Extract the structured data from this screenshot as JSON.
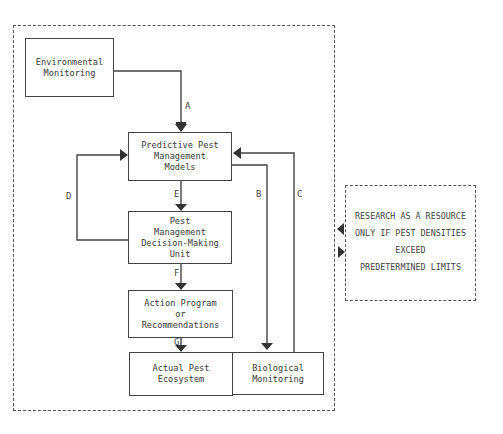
{
  "diagram": {
    "nodes": {
      "env": {
        "label": "Environmental\nMonitoring"
      },
      "predictive": {
        "label": "Predictive Pest\nManagement\nModels"
      },
      "decision": {
        "label": "Pest\nManagement\nDecision-Making\nUnit"
      },
      "action": {
        "label": "Action Program\nor\nRecommendations"
      },
      "ecosystem": {
        "label": "Actual Pest\nEcosystem"
      },
      "bio": {
        "label": "Biological\nMonitoring"
      }
    },
    "edges": {
      "A": "A",
      "B": "B",
      "C": "C",
      "D": "D",
      "E": "E",
      "F": "F",
      "G": "G"
    },
    "research_note": {
      "text": "RESEARCH AS A RESOURCE\nONLY IF PEST DENSITIES\nEXCEED\nPREDETERMINED LIMITS"
    }
  }
}
